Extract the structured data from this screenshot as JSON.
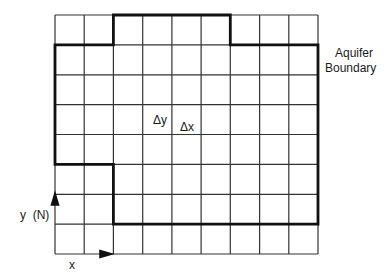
{
  "diagram": {
    "type": "finite-difference grid",
    "grid": {
      "columns": 9,
      "rows": 8,
      "left": 55,
      "top": 15,
      "cell_w": 29.2,
      "cell_h": 29.9
    },
    "boundary_label": [
      "Aquifer",
      "Boundary"
    ],
    "cell_labels": {
      "dy": "Δy",
      "dx": "Δx"
    },
    "axes": {
      "y_label": "y  (N)",
      "x_label": "x"
    },
    "colors": {
      "line": "#1a1a1a",
      "background": "#ffffff"
    }
  }
}
